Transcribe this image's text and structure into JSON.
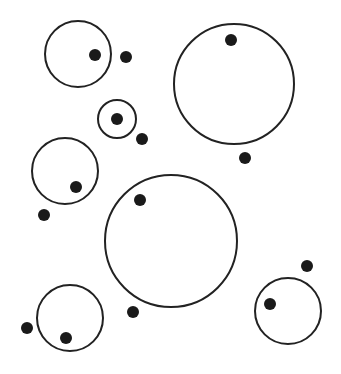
{
  "diagram": {
    "width": 341,
    "height": 374,
    "background": "#ffffff",
    "stroke_color": "#222222",
    "dot_color": "#1a1a1a",
    "stroke_width": 2,
    "dot_radius": 6,
    "circles": [
      {
        "id": "circle-top-left",
        "cx": 78,
        "cy": 54,
        "r": 33
      },
      {
        "id": "circle-small",
        "cx": 117,
        "cy": 119,
        "r": 19
      },
      {
        "id": "circle-top-right-large",
        "cx": 234,
        "cy": 84,
        "r": 60
      },
      {
        "id": "circle-middle-left",
        "cx": 65,
        "cy": 171,
        "r": 33
      },
      {
        "id": "circle-center-large",
        "cx": 171,
        "cy": 241,
        "r": 66
      },
      {
        "id": "circle-bottom-left",
        "cx": 70,
        "cy": 318,
        "r": 33
      },
      {
        "id": "circle-bottom-right",
        "cx": 288,
        "cy": 311,
        "r": 33
      }
    ],
    "dots": [
      {
        "id": "dot-1",
        "cx": 95,
        "cy": 55
      },
      {
        "id": "dot-2",
        "cx": 126,
        "cy": 57
      },
      {
        "id": "dot-3",
        "cx": 117,
        "cy": 119
      },
      {
        "id": "dot-4",
        "cx": 142,
        "cy": 139
      },
      {
        "id": "dot-5",
        "cx": 231,
        "cy": 40
      },
      {
        "id": "dot-6",
        "cx": 245,
        "cy": 158
      },
      {
        "id": "dot-7",
        "cx": 76,
        "cy": 187
      },
      {
        "id": "dot-8",
        "cx": 44,
        "cy": 215
      },
      {
        "id": "dot-9",
        "cx": 140,
        "cy": 200
      },
      {
        "id": "dot-10",
        "cx": 307,
        "cy": 266
      },
      {
        "id": "dot-11",
        "cx": 270,
        "cy": 304
      },
      {
        "id": "dot-12",
        "cx": 133,
        "cy": 312
      },
      {
        "id": "dot-13",
        "cx": 27,
        "cy": 328
      },
      {
        "id": "dot-14",
        "cx": 66,
        "cy": 338
      }
    ]
  }
}
